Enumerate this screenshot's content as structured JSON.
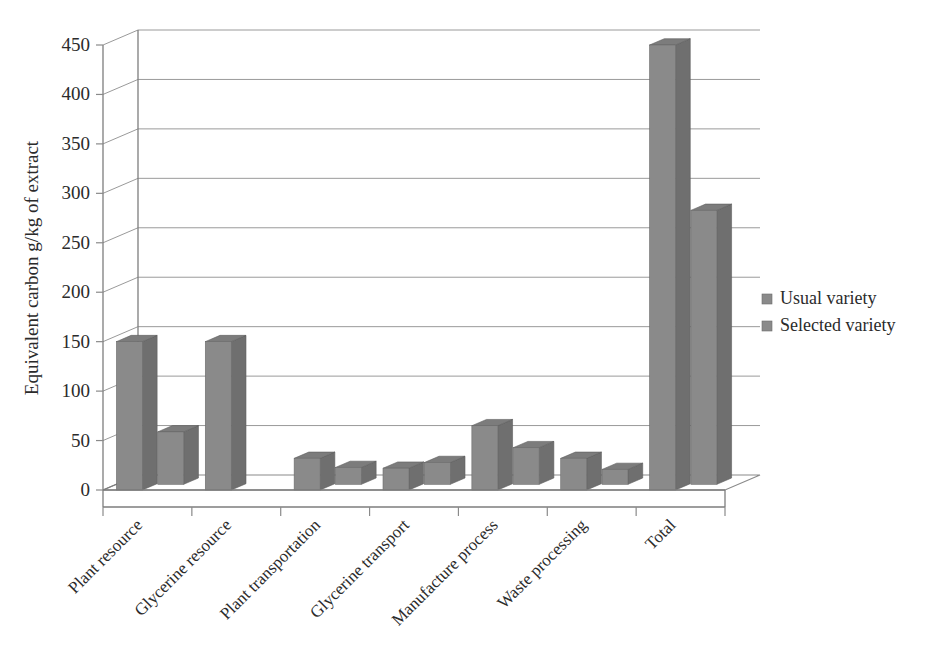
{
  "chart_data": {
    "type": "bar",
    "title": "",
    "subtitle": "",
    "xlabel": "",
    "ylabel": "Equivalent carbon g/kg of extract",
    "ylim": [
      0,
      450
    ],
    "ytick_values": [
      0,
      50,
      100,
      150,
      200,
      250,
      300,
      350,
      400,
      450
    ],
    "ytick_labels": [
      "0",
      "50",
      "100",
      "150",
      "200",
      "250",
      "300",
      "350",
      "400",
      "450"
    ],
    "grid": true,
    "grid_axis": "y",
    "three_d": true,
    "legend_position": "right",
    "categories": [
      "Plant resource",
      "Glycerine resource",
      "Plant transportation",
      "Glycerine transport",
      "Manufacture process",
      "Waste processing",
      "Total"
    ],
    "series": [
      {
        "name": "Usual variety",
        "color": "#8a8a8a",
        "values": [
          150,
          150,
          32,
          22,
          65,
          32,
          450
        ]
      },
      {
        "name": "Selected variety",
        "color": "#8a8a8a",
        "values": [
          53,
          0,
          17,
          22,
          37,
          15,
          277
        ]
      }
    ]
  },
  "legend": {
    "items": [
      {
        "label": "Usual variety",
        "marker": "square-marker",
        "color": "#8a8a8a"
      },
      {
        "label": "Selected variety",
        "marker": "square-marker",
        "color": "#8a8a8a"
      }
    ]
  },
  "axes": {
    "y_title": "Equivalent carbon g/kg of extract",
    "y_labels": [
      "450",
      "400",
      "350",
      "300",
      "250",
      "200",
      "150",
      "100",
      "50",
      "0"
    ],
    "x_labels": [
      "Plant resource",
      "Glycerine resource",
      "Plant transportation",
      "Glycerine transport",
      "Manufacture process",
      "Waste processing",
      "Total"
    ]
  },
  "colors": {
    "bar_front": "#8a8a8a",
    "bar_top": "#7c7c7c",
    "bar_side": "#6f6f6f",
    "grid": "#9a9a9a",
    "axis": "#7d7d7d",
    "text": "#2b2b2b",
    "background": "#ffffff"
  }
}
